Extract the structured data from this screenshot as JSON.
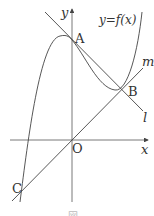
{
  "figure": {
    "curve_label": "y=f(x)",
    "axis_x_label": "x",
    "axis_y_label": "y",
    "origin_label": "O",
    "points": [
      {
        "name": "A",
        "label": "A"
      },
      {
        "name": "B",
        "label": "B"
      },
      {
        "name": "C",
        "label": "C"
      }
    ],
    "lines": [
      {
        "name": "l",
        "label": "l"
      },
      {
        "name": "m",
        "label": "m"
      }
    ],
    "caption": "図"
  },
  "colors": {
    "stroke": "#444444",
    "text": "#333333"
  }
}
